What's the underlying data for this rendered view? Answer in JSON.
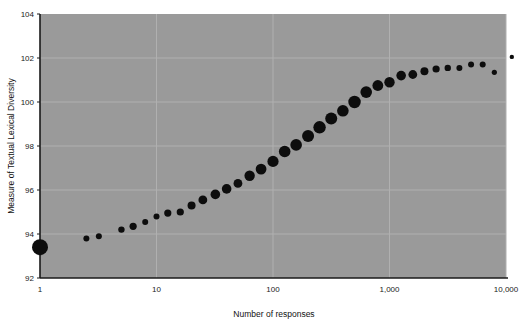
{
  "chart_data": {
    "type": "scatter",
    "title": "",
    "subtitle": "",
    "xlabel": "Number of responses",
    "ylabel": "Measure of Textual Lexical Diversity",
    "xscale": "log",
    "yscale": "linear",
    "xlim": [
      1,
      10000
    ],
    "ylim": [
      92,
      104
    ],
    "grid": true,
    "legend": null,
    "legend_position": "none",
    "xticks": [
      1,
      10,
      100,
      1000,
      10000
    ],
    "xtick_labels": [
      "1",
      "10",
      "100",
      "1,000",
      "10,000"
    ],
    "yticks": [
      92,
      94,
      96,
      98,
      100,
      102,
      104
    ],
    "ytick_labels": [
      "92",
      "94",
      "96",
      "98",
      "100",
      "102",
      "104"
    ],
    "marker_color": "#0d0d0d",
    "plot_background": "#9a9a9a",
    "figure_background": "#ffffff",
    "grid_color": "#b0b0b0",
    "axis_color": "#1a1a1a",
    "note": "Marker area varies with sample size; first point at x=1 is largest.",
    "points": [
      {
        "x": 1,
        "y": 93.4,
        "r": 8.0
      },
      {
        "x": 2.5,
        "y": 93.8,
        "r": 3.0
      },
      {
        "x": 3.2,
        "y": 93.9,
        "r": 3.0
      },
      {
        "x": 5.0,
        "y": 94.2,
        "r": 3.2
      },
      {
        "x": 6.3,
        "y": 94.35,
        "r": 3.6
      },
      {
        "x": 8.0,
        "y": 94.55,
        "r": 3.0
      },
      {
        "x": 10,
        "y": 94.8,
        "r": 3.0
      },
      {
        "x": 12.5,
        "y": 94.95,
        "r": 3.6
      },
      {
        "x": 16,
        "y": 95.0,
        "r": 3.6
      },
      {
        "x": 20,
        "y": 95.3,
        "r": 4.0
      },
      {
        "x": 25,
        "y": 95.55,
        "r": 4.4
      },
      {
        "x": 32,
        "y": 95.8,
        "r": 4.8
      },
      {
        "x": 40,
        "y": 96.05,
        "r": 4.8
      },
      {
        "x": 50,
        "y": 96.3,
        "r": 4.4
      },
      {
        "x": 63,
        "y": 96.65,
        "r": 5.2
      },
      {
        "x": 79,
        "y": 96.95,
        "r": 5.4
      },
      {
        "x": 100,
        "y": 97.3,
        "r": 5.6
      },
      {
        "x": 126,
        "y": 97.75,
        "r": 5.8
      },
      {
        "x": 158,
        "y": 98.05,
        "r": 5.8
      },
      {
        "x": 200,
        "y": 98.45,
        "r": 6.0
      },
      {
        "x": 251,
        "y": 98.85,
        "r": 6.2
      },
      {
        "x": 316,
        "y": 99.25,
        "r": 6.0
      },
      {
        "x": 398,
        "y": 99.6,
        "r": 5.8
      },
      {
        "x": 501,
        "y": 100.0,
        "r": 6.2
      },
      {
        "x": 631,
        "y": 100.45,
        "r": 5.8
      },
      {
        "x": 794,
        "y": 100.75,
        "r": 5.4
      },
      {
        "x": 1000,
        "y": 100.9,
        "r": 5.2
      },
      {
        "x": 1259,
        "y": 101.2,
        "r": 4.8
      },
      {
        "x": 1585,
        "y": 101.25,
        "r": 4.4
      },
      {
        "x": 1995,
        "y": 101.4,
        "r": 4.0
      },
      {
        "x": 2512,
        "y": 101.5,
        "r": 3.6
      },
      {
        "x": 3162,
        "y": 101.55,
        "r": 3.2
      },
      {
        "x": 3981,
        "y": 101.55,
        "r": 3.0
      },
      {
        "x": 5012,
        "y": 101.7,
        "r": 3.0
      },
      {
        "x": 6310,
        "y": 101.7,
        "r": 3.0
      },
      {
        "x": 7943,
        "y": 101.35,
        "r": 2.6
      },
      {
        "x": 11220,
        "y": 102.05,
        "r": 2.2
      }
    ]
  }
}
